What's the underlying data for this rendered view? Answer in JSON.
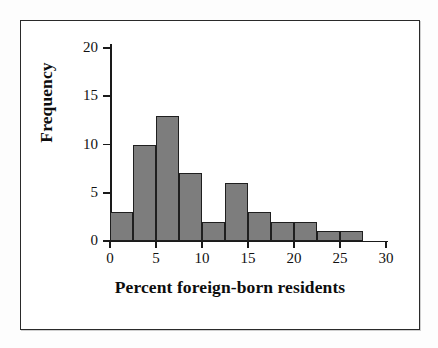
{
  "figure": {
    "frame_color": "#2a2a2a",
    "background": "#ffffff"
  },
  "chart_data": {
    "type": "bar",
    "title": "",
    "xlabel": "Percent foreign-born residents",
    "ylabel": "Frequency",
    "xlim": [
      0,
      30
    ],
    "ylim": [
      0,
      20
    ],
    "grid": false,
    "legend": null,
    "bin_width": 2.5,
    "bar_color": "#7d7d7d",
    "bar_edge_color": "#1f1f1f",
    "xticks": [
      0,
      5,
      10,
      15,
      20,
      25,
      30
    ],
    "xtick_labels": [
      "0",
      "5",
      "10",
      "15",
      "20",
      "25",
      "30"
    ],
    "yticks": [
      0,
      5,
      10,
      15,
      20
    ],
    "ytick_labels": [
      "0",
      "5",
      "10",
      "15",
      "20"
    ],
    "bins": [
      {
        "start": 0.0,
        "end": 2.5,
        "value": 3
      },
      {
        "start": 2.5,
        "end": 5.0,
        "value": 10
      },
      {
        "start": 5.0,
        "end": 7.5,
        "value": 13
      },
      {
        "start": 7.5,
        "end": 10.0,
        "value": 7
      },
      {
        "start": 10.0,
        "end": 12.5,
        "value": 2
      },
      {
        "start": 12.5,
        "end": 15.0,
        "value": 6
      },
      {
        "start": 15.0,
        "end": 17.5,
        "value": 3
      },
      {
        "start": 17.5,
        "end": 20.0,
        "value": 2
      },
      {
        "start": 20.0,
        "end": 22.5,
        "value": 2
      },
      {
        "start": 22.5,
        "end": 25.0,
        "value": 1
      },
      {
        "start": 25.0,
        "end": 27.5,
        "value": 1
      }
    ],
    "categories": [
      "0-2.5",
      "2.5-5",
      "5-7.5",
      "7.5-10",
      "10-12.5",
      "12.5-15",
      "15-17.5",
      "17.5-20",
      "20-22.5",
      "22.5-25",
      "25-27.5"
    ],
    "values": [
      3,
      10,
      13,
      7,
      2,
      6,
      3,
      2,
      2,
      1,
      1
    ]
  }
}
